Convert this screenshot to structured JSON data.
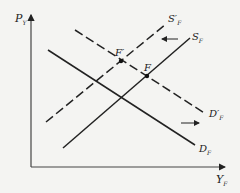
{
  "diagram": {
    "type": "supply-demand-shift",
    "axes": {
      "y_label": "P",
      "y_label_sub": "Y",
      "x_label": "Y",
      "x_label_sub": "F"
    },
    "curves": [
      {
        "id": "S_F",
        "label": "S",
        "sub": "F",
        "prime": "",
        "style": "solid",
        "slope": "up"
      },
      {
        "id": "S_F_prime",
        "label": "S",
        "sub": "F",
        "prime": "′",
        "style": "dashed",
        "slope": "up"
      },
      {
        "id": "D_F",
        "label": "D",
        "sub": "F",
        "prime": "",
        "style": "solid",
        "slope": "down"
      },
      {
        "id": "D_F_prime",
        "label": "D",
        "sub": "F",
        "prime": "′",
        "style": "dashed",
        "slope": "down"
      }
    ],
    "points": [
      {
        "id": "F_prime",
        "label": "F′"
      },
      {
        "id": "F",
        "label": "F"
      }
    ],
    "arrows": [
      {
        "id": "supply-shift-arrow",
        "direction": "left"
      },
      {
        "id": "demand-shift-arrow",
        "direction": "right"
      }
    ],
    "colors": {
      "line": "#222222",
      "background": "#f4f4f2"
    }
  },
  "labels": {
    "y_axis": "P",
    "y_axis_sub": "Y",
    "x_axis": "Y",
    "x_axis_sub": "F",
    "s_f": "S",
    "s_f_sub": "F",
    "s_f_prime": "S′",
    "s_f_prime_sub": "F",
    "d_f": "D",
    "d_f_sub": "F",
    "d_f_prime": "D′",
    "d_f_prime_sub": "F",
    "point_f_prime": "F′",
    "point_f": "F"
  }
}
